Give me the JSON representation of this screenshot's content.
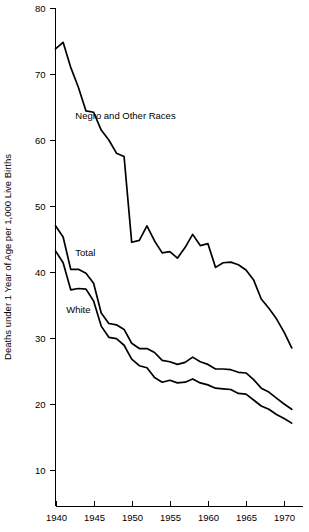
{
  "chart_data": {
    "type": "line",
    "title": "",
    "subtitle": "",
    "xlabel": "",
    "ylabel": "Deaths under 1 Year of Age per 1,000 Live Births",
    "xlim": [
      1940,
      1971
    ],
    "ylim": [
      4,
      80
    ],
    "grid": false,
    "legend_position": "inline-annotations",
    "xticks": [
      1940,
      1945,
      1950,
      1955,
      1960,
      1965,
      1970
    ],
    "xtick_labels": [
      "1940",
      "1945",
      "1950",
      "1955",
      "1960",
      "1965",
      "1970"
    ],
    "yticks": [
      10,
      20,
      30,
      40,
      50,
      60,
      70,
      80
    ],
    "ytick_labels": [
      "10",
      "20",
      "30",
      "40",
      "50",
      "60",
      "70",
      "80"
    ],
    "x": [
      1940,
      1941,
      1942,
      1943,
      1944,
      1945,
      1946,
      1947,
      1948,
      1949,
      1950,
      1951,
      1952,
      1953,
      1954,
      1955,
      1956,
      1957,
      1958,
      1959,
      1960,
      1961,
      1962,
      1963,
      1964,
      1965,
      1966,
      1967,
      1968,
      1969,
      1970,
      1971
    ],
    "series": [
      {
        "name": "Negro and Other Races",
        "label_x": 1942.6,
        "label_y": 63.2,
        "color": "#000000",
        "values": [
          73.8,
          74.8,
          71.0,
          68.0,
          64.4,
          64.2,
          61.5,
          60.0,
          58.0,
          57.5,
          44.5,
          44.8,
          47.0,
          44.7,
          42.9,
          43.1,
          42.1,
          43.7,
          45.7,
          44.0,
          44.3,
          40.7,
          41.4,
          41.5,
          41.1,
          40.3,
          38.8,
          35.9,
          34.5,
          32.9,
          30.9,
          28.5
        ],
        "y_scale_note": "values after 1949 plotted on the 1950 discontinuity"
      },
      {
        "name": "Total",
        "label_x": 1942.6,
        "label_y": 42.4,
        "color": "#000000",
        "values": [
          47.0,
          45.3,
          40.4,
          40.4,
          39.8,
          38.3,
          33.8,
          32.2,
          32.0,
          31.3,
          29.2,
          28.4,
          28.4,
          27.8,
          26.6,
          26.4,
          26.0,
          26.3,
          27.1,
          26.4,
          26.0,
          25.3,
          25.3,
          25.2,
          24.8,
          24.7,
          23.7,
          22.4,
          21.8,
          20.9,
          20.0,
          19.2
        ]
      },
      {
        "name": "White",
        "label_x": 1941.4,
        "label_y": 33.8,
        "color": "#000000",
        "values": [
          43.2,
          41.4,
          37.3,
          37.5,
          37.4,
          35.6,
          31.8,
          30.1,
          29.9,
          28.9,
          26.8,
          25.8,
          25.5,
          24.0,
          23.3,
          23.6,
          23.2,
          23.3,
          23.8,
          23.2,
          22.9,
          22.4,
          22.3,
          22.2,
          21.6,
          21.5,
          20.6,
          19.7,
          19.2,
          18.4,
          17.8,
          17.1
        ]
      }
    ]
  },
  "figure": {
    "y_axis_title": "Deaths under 1 Year of Age per 1,000 Live Births"
  }
}
